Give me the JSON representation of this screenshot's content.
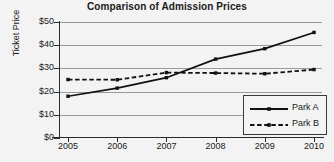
{
  "chart_data": {
    "type": "line",
    "title": "Comparison of Admission Prices",
    "xlabel": "",
    "ylabel": "Ticket Price",
    "categories": [
      "2005",
      "2006",
      "2007",
      "2008",
      "2009",
      "2010"
    ],
    "x": [
      2005,
      2006,
      2007,
      2008,
      2009,
      2010
    ],
    "ylim": [
      0,
      50
    ],
    "ytick_labels": [
      "$0",
      "$10",
      "$20",
      "$30",
      "$40",
      "$50"
    ],
    "ytick_values": [
      0,
      10,
      20,
      30,
      40,
      50
    ],
    "grid": true,
    "legend_position": "lower right",
    "series": [
      {
        "name": "Park A",
        "style": "solid",
        "marker": "square",
        "color": "#111111",
        "values": [
          18.0,
          21.5,
          26.0,
          34.0,
          38.5,
          45.5
        ]
      },
      {
        "name": "Park B",
        "style": "dashed",
        "marker": "square",
        "color": "#111111",
        "values": [
          25.2,
          25.1,
          28.2,
          28.0,
          27.7,
          29.5
        ]
      }
    ]
  },
  "legend": {
    "items": [
      {
        "label": "Park A"
      },
      {
        "label": "Park B"
      }
    ]
  }
}
